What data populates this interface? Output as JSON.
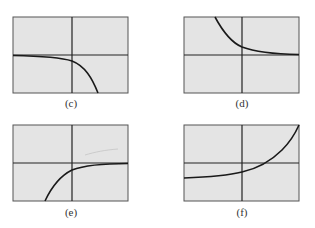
{
  "figure": {
    "colors": {
      "screen": "#e4e4e4",
      "border": "#555555",
      "axis": "#222222",
      "curve": "#1a1a1a"
    },
    "panels": [
      {
        "id": "c",
        "label": "(c)",
        "description": "Decreasing curve approaching horizontal asymptote from left, falling steeply on right"
      },
      {
        "id": "d",
        "label": "(d)",
        "description": "Decreasing curve from upper left approaching x-axis asymptote on right"
      },
      {
        "id": "e",
        "label": "(e)",
        "description": "Increasing curve rising from lower left and leveling off toward x-axis on right"
      },
      {
        "id": "f",
        "label": "(f)",
        "description": "Increasing exponential curve, flat below x-axis on left, rising steeply on right"
      }
    ]
  }
}
